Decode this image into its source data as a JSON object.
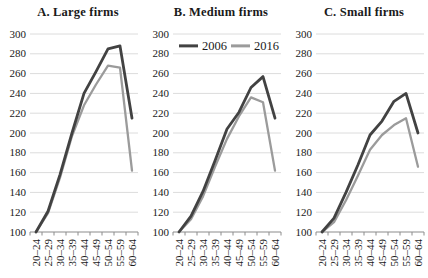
{
  "figure": {
    "background": "#ffffff"
  },
  "colors": {
    "series_2006": "#424242",
    "series_2016": "#9b9b9b",
    "grid": "#dcdcdc",
    "axis": "#8c8c8c",
    "text": "#1a1a1a"
  },
  "chart_data": [
    {
      "type": "line",
      "title": "A. Large firms",
      "categories": [
        "20–24",
        "25–29",
        "30–34",
        "35–39",
        "40–44",
        "45–49",
        "50–54",
        "55–59",
        "60–64"
      ],
      "series": [
        {
          "name": "2006",
          "color": "#424242",
          "values": [
            100,
            121,
            158,
            200,
            240,
            262,
            285,
            288,
            215
          ]
        },
        {
          "name": "2016",
          "color": "#9b9b9b",
          "values": [
            100,
            119,
            155,
            197,
            228,
            249,
            268,
            266,
            162
          ]
        }
      ],
      "xlabel": "",
      "ylabel": "",
      "ylim": [
        100,
        300
      ],
      "yticks": [
        100,
        120,
        140,
        160,
        180,
        200,
        220,
        240,
        260,
        280,
        300
      ],
      "grid": true,
      "legend": {
        "show": false,
        "position": ""
      }
    },
    {
      "type": "line",
      "title": "B. Medium firms",
      "categories": [
        "20–24",
        "25–29",
        "30–34",
        "35–39",
        "40–44",
        "45–49",
        "50–54",
        "55–59",
        "60–64"
      ],
      "series": [
        {
          "name": "2006",
          "color": "#424242",
          "values": [
            100,
            116,
            141,
            172,
            204,
            221,
            246,
            257,
            215
          ]
        },
        {
          "name": "2016",
          "color": "#9b9b9b",
          "values": [
            100,
            113,
            136,
            166,
            194,
            217,
            236,
            231,
            162
          ]
        }
      ],
      "xlabel": "",
      "ylabel": "",
      "ylim": [
        100,
        300
      ],
      "yticks": [
        100,
        120,
        140,
        160,
        180,
        200,
        220,
        240,
        260,
        280,
        300
      ],
      "grid": true,
      "legend": {
        "show": true,
        "position": "top-inside"
      }
    },
    {
      "type": "line",
      "title": "C. Small firms",
      "categories": [
        "20–24",
        "25–29",
        "30–34",
        "35–39",
        "40–44",
        "45–49",
        "50–54",
        "55–59",
        "60–64"
      ],
      "series": [
        {
          "name": "2006",
          "color": "#424242",
          "values": [
            100,
            114,
            140,
            168,
            198,
            212,
            232,
            240,
            200
          ]
        },
        {
          "name": "2016",
          "color": "#9b9b9b",
          "values": [
            100,
            110,
            132,
            157,
            183,
            198,
            208,
            215,
            166
          ]
        }
      ],
      "xlabel": "",
      "ylabel": "",
      "ylim": [
        100,
        300
      ],
      "yticks": [
        100,
        120,
        140,
        160,
        180,
        200,
        220,
        240,
        260,
        280,
        300
      ],
      "grid": true,
      "legend": {
        "show": false,
        "position": ""
      }
    }
  ]
}
